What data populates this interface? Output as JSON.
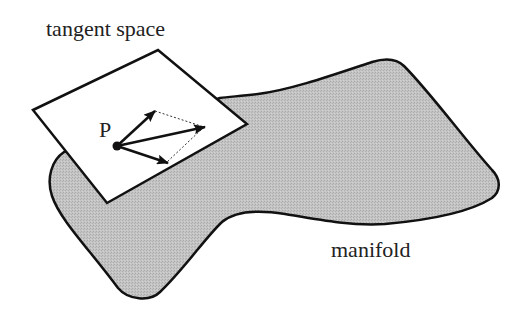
{
  "diagram": {
    "title_label": "tangent space",
    "manifold_label": "manifold",
    "point_label": "P",
    "colors": {
      "manifold_fill": "#bdbdbd",
      "stroke": "#111111",
      "plane_fill": "#ffffff",
      "text": "#222222"
    },
    "elements": [
      {
        "name": "manifold",
        "type": "curved-surface"
      },
      {
        "name": "tangent-plane",
        "type": "parallelogram"
      },
      {
        "name": "point-P",
        "type": "dot"
      },
      {
        "name": "vector-1",
        "type": "arrow"
      },
      {
        "name": "vector-2",
        "type": "arrow"
      },
      {
        "name": "vector-sum",
        "type": "arrow"
      },
      {
        "name": "parallelogram-guides",
        "type": "dotted-lines"
      }
    ]
  }
}
